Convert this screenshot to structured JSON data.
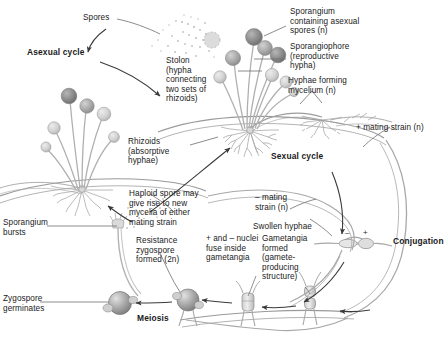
{
  "diagram": {
    "colors": {
      "line": "#8d8d8d",
      "dark_line": "#6b6b6b",
      "text": "#1a1a1a",
      "sporangium_dark": "#8a8a8a",
      "sporangium_mid": "#a9a9a9",
      "sporangium_light": "#c9c9c9",
      "zygospore": "#9b9b9b",
      "background": "#ffffff"
    },
    "labels": {
      "spores": "Spores",
      "asexual_cycle": "Asexual cycle",
      "sporangium_asexual": "Sporangium\ncontaining asexual\nspores (n)",
      "sporangiophore": "Sporangiophore\n(reproductive\nhypha)",
      "stolon": "Stolon\n(hypha\nconnecting\ntwo sets of\nrhizoids)",
      "hyphae_mycelium": "Hyphae forming\nmycelium (n)",
      "rhizoids": "Rhizoids\n(absorptive\nhyphae)",
      "plus_mating_strain": "+ mating strain (n)",
      "sexual_cycle": "Sexual cycle",
      "minus_mating_strain": "– mating\nstrain (n)",
      "haploid_spore": "Haploid spore may\ngive rise to new\nmycelia of either\nmating strain",
      "swollen_hyphae": "Swollen hyphae",
      "conjugation": "Conjugation",
      "nuclei_fuse": "+ and – nuclei\nfuse inside\ngametangia",
      "gametangia": "Gametangia\nformed\n(gamete-\nproducing\nstructure)",
      "resistance_zygospore": "Resistance\nzygospore\nformed (2n)",
      "sporangium_bursts": "Sporangium\nbursts",
      "zygospore_germinates": "Zygospore\ngerminates",
      "meiosis": "Meiosis",
      "sign_minus": "–",
      "sign_plus": "+"
    }
  }
}
